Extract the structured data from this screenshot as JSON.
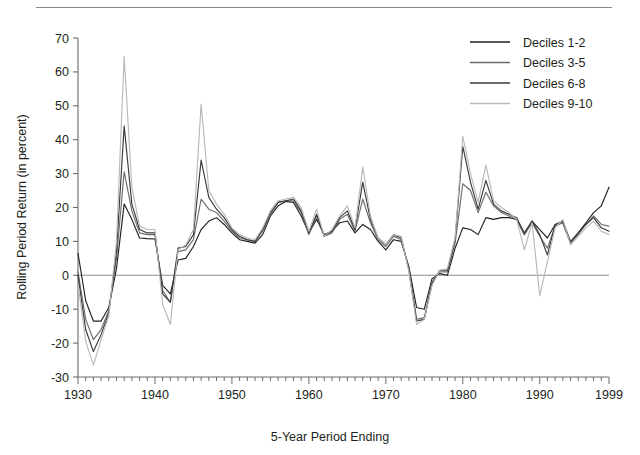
{
  "chart_data": {
    "type": "line",
    "title": "",
    "xlabel": "5-Year Period Ending",
    "ylabel": "Rolling Period Return (in percent)",
    "xlim": [
      1930,
      1999
    ],
    "ylim": [
      -30,
      70
    ],
    "xticks": [
      1930,
      1940,
      1950,
      1960,
      1970,
      1980,
      1990,
      1999
    ],
    "xtick_labels": [
      "1930",
      "1940",
      "1950",
      "1960",
      "1970",
      "1980",
      "1990",
      "1999"
    ],
    "yticks": [
      -30,
      -20,
      -10,
      0,
      10,
      20,
      30,
      40,
      50,
      60,
      70
    ],
    "ytick_labels": [
      "-30",
      "-20",
      "-10",
      "0",
      "10",
      "20",
      "30",
      "40",
      "50",
      "60",
      "70"
    ],
    "minor_xticks_interval": 1,
    "grid": false,
    "zero_line": true,
    "legend_position": "top-right",
    "x": [
      1930,
      1931,
      1932,
      1933,
      1934,
      1935,
      1936,
      1937,
      1938,
      1939,
      1940,
      1941,
      1942,
      1943,
      1944,
      1945,
      1946,
      1947,
      1948,
      1949,
      1950,
      1951,
      1952,
      1953,
      1954,
      1955,
      1956,
      1957,
      1958,
      1959,
      1960,
      1961,
      1962,
      1963,
      1964,
      1965,
      1966,
      1967,
      1968,
      1969,
      1970,
      1971,
      1972,
      1973,
      1974,
      1975,
      1976,
      1977,
      1978,
      1979,
      1980,
      1981,
      1982,
      1983,
      1984,
      1985,
      1986,
      1987,
      1988,
      1989,
      1990,
      1991,
      1992,
      1993,
      1994,
      1995,
      1996,
      1997,
      1998,
      1999
    ],
    "series": [
      {
        "name": "Deciles 1-2",
        "color": "#231f20",
        "values": [
          6.5,
          -7.5,
          -13.5,
          -13.5,
          -9.5,
          2.0,
          21.0,
          16.5,
          11.0,
          10.8,
          10.7,
          -3.0,
          -5.5,
          4.5,
          5.0,
          8.5,
          13.5,
          16.0,
          17.0,
          15.0,
          12.5,
          10.5,
          10.0,
          9.5,
          12.0,
          17.5,
          20.5,
          21.8,
          21.5,
          17.5,
          12.5,
          16.5,
          12.0,
          13.0,
          15.5,
          16.0,
          12.5,
          15.0,
          13.5,
          10.0,
          7.5,
          10.5,
          10.0,
          2.5,
          -9.5,
          -10.0,
          -1.0,
          0.5,
          0.0,
          8.0,
          14.0,
          13.5,
          12.0,
          17.0,
          16.5,
          17.0,
          17.0,
          16.5,
          12.0,
          16.0,
          13.5,
          11.0,
          15.0,
          15.5,
          9.5,
          12.5,
          15.5,
          18.5,
          20.5,
          26.0
        ]
      },
      {
        "name": "Deciles 3-5",
        "color": "#6d6d6d",
        "values": [
          1.0,
          -13.0,
          -19.0,
          -16.0,
          -10.5,
          5.0,
          30.5,
          19.0,
          12.5,
          12.0,
          12.0,
          -4.5,
          -8.0,
          7.0,
          7.5,
          10.5,
          22.5,
          19.5,
          18.5,
          16.0,
          13.0,
          11.0,
          10.5,
          10.0,
          13.0,
          18.0,
          21.5,
          22.0,
          22.0,
          18.5,
          12.0,
          17.5,
          11.5,
          12.5,
          16.5,
          18.0,
          13.0,
          22.5,
          15.5,
          10.5,
          8.5,
          11.5,
          10.5,
          2.0,
          -13.0,
          -12.5,
          -2.0,
          1.0,
          1.0,
          9.5,
          27.0,
          25.0,
          18.5,
          24.5,
          20.5,
          18.5,
          17.5,
          16.5,
          12.0,
          15.5,
          11.5,
          8.0,
          14.5,
          15.5,
          9.5,
          12.0,
          15.0,
          17.5,
          15.0,
          14.5
        ]
      },
      {
        "name": "Deciles 6-8",
        "color": "#3a3a3a",
        "values": [
          0.0,
          -16.0,
          -22.5,
          -17.5,
          -11.0,
          7.0,
          44.0,
          21.0,
          13.5,
          12.5,
          12.5,
          -5.5,
          -8.0,
          8.0,
          8.5,
          12.0,
          34.0,
          23.0,
          19.5,
          17.0,
          13.5,
          11.5,
          10.5,
          10.0,
          13.5,
          18.5,
          21.5,
          22.0,
          22.5,
          19.0,
          12.5,
          18.0,
          11.5,
          13.0,
          17.0,
          19.0,
          13.5,
          27.5,
          16.5,
          11.0,
          9.0,
          12.0,
          11.0,
          1.5,
          -13.5,
          -13.0,
          -2.5,
          1.5,
          1.5,
          10.5,
          38.0,
          27.5,
          19.5,
          28.0,
          21.0,
          19.0,
          18.0,
          17.0,
          12.5,
          16.0,
          12.0,
          6.0,
          15.0,
          16.0,
          10.0,
          12.5,
          15.0,
          17.0,
          14.0,
          13.0
        ]
      },
      {
        "name": "Deciles 9-10",
        "color": "#b9b9b9",
        "values": [
          -2.5,
          -19.5,
          -26.5,
          -19.0,
          -12.0,
          10.0,
          64.5,
          26.0,
          14.5,
          13.5,
          13.5,
          -8.5,
          -14.5,
          7.5,
          9.0,
          13.5,
          50.5,
          25.0,
          21.0,
          18.0,
          14.0,
          12.0,
          11.0,
          10.5,
          14.0,
          19.0,
          22.0,
          22.5,
          23.0,
          20.0,
          13.0,
          19.5,
          11.5,
          13.5,
          17.5,
          20.5,
          14.0,
          32.0,
          17.5,
          11.0,
          9.0,
          12.0,
          11.5,
          1.0,
          -14.5,
          -13.0,
          -3.0,
          1.5,
          2.0,
          11.0,
          41.0,
          30.0,
          21.5,
          32.5,
          22.0,
          20.0,
          18.5,
          16.5,
          7.5,
          15.5,
          -6.0,
          4.0,
          14.0,
          16.5,
          9.0,
          11.5,
          14.0,
          16.0,
          13.0,
          12.0
        ]
      }
    ]
  },
  "legend": {
    "items": [
      {
        "label": "Deciles 1-2"
      },
      {
        "label": "Deciles 3-5"
      },
      {
        "label": "Deciles 6-8"
      },
      {
        "label": "Deciles 9-10"
      }
    ]
  }
}
